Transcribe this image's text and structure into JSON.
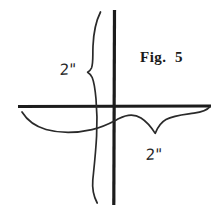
{
  "figure": {
    "caption": "Fig.  5",
    "background_color": "#ffffff",
    "stroke_color": "#1c1c1c",
    "caption_color": "#1a1a1a",
    "label_color": "#262626",
    "dimensions": {
      "width": 223,
      "height": 217
    },
    "labels": {
      "vertical_dimension": "2\"",
      "horizontal_dimension": "2\""
    },
    "elements": {
      "horizontal_axis_name": "horizontal-axis-line",
      "vertical_axis_name": "vertical-axis-line",
      "vertical_brace_name": "vertical-brace-curve",
      "horizontal_brace_name": "horizontal-brace-curve"
    }
  }
}
